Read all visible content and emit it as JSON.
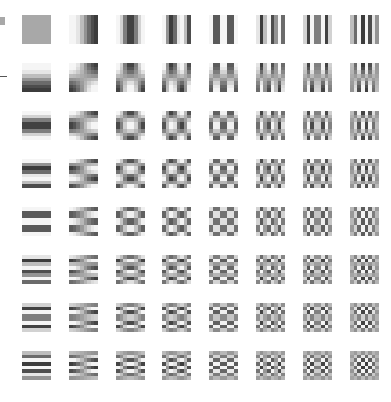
{
  "figure": {
    "rows": 8,
    "cols": 8,
    "block_size": 8,
    "tile_size_px": 29,
    "origin_px": [
      22,
      15
    ],
    "step_px": [
      46.8,
      48
    ],
    "gray_range": [
      "#2a2a2a",
      "#f0f0f0"
    ],
    "mid_gray": "#a8a8a8"
  },
  "basis": [
    [
      [
        0,
        0
      ],
      [
        0,
        1
      ],
      [
        0,
        2
      ],
      [
        0,
        3
      ],
      [
        0,
        4
      ],
      [
        0,
        5
      ],
      [
        0,
        6
      ],
      [
        0,
        7
      ]
    ],
    [
      [
        1,
        0
      ],
      [
        1,
        1
      ],
      [
        1,
        2
      ],
      [
        1,
        3
      ],
      [
        1,
        4
      ],
      [
        1,
        5
      ],
      [
        1,
        6
      ],
      [
        1,
        7
      ]
    ],
    [
      [
        2,
        0
      ],
      [
        2,
        1
      ],
      [
        2,
        2
      ],
      [
        2,
        3
      ],
      [
        2,
        4
      ],
      [
        2,
        5
      ],
      [
        2,
        6
      ],
      [
        2,
        7
      ]
    ],
    [
      [
        3,
        0
      ],
      [
        3,
        1
      ],
      [
        3,
        2
      ],
      [
        3,
        3
      ],
      [
        3,
        4
      ],
      [
        3,
        5
      ],
      [
        3,
        6
      ],
      [
        3,
        7
      ]
    ],
    [
      [
        4,
        0
      ],
      [
        4,
        1
      ],
      [
        4,
        2
      ],
      [
        4,
        3
      ],
      [
        4,
        4
      ],
      [
        4,
        5
      ],
      [
        4,
        6
      ],
      [
        4,
        7
      ]
    ],
    [
      [
        5,
        0
      ],
      [
        5,
        1
      ],
      [
        5,
        2
      ],
      [
        5,
        3
      ],
      [
        5,
        4
      ],
      [
        5,
        5
      ],
      [
        5,
        6
      ],
      [
        5,
        7
      ]
    ],
    [
      [
        6,
        0
      ],
      [
        6,
        1
      ],
      [
        6,
        2
      ],
      [
        6,
        3
      ],
      [
        6,
        4
      ],
      [
        6,
        5
      ],
      [
        6,
        6
      ],
      [
        6,
        7
      ]
    ],
    [
      [
        7,
        0
      ],
      [
        7,
        1
      ],
      [
        7,
        2
      ],
      [
        7,
        3
      ],
      [
        7,
        4
      ],
      [
        7,
        5
      ],
      [
        7,
        6
      ],
      [
        7,
        7
      ]
    ]
  ]
}
